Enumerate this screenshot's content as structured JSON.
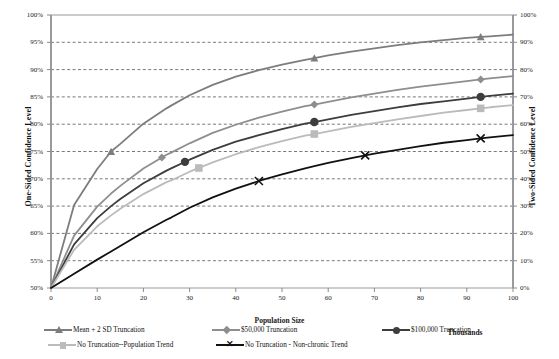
{
  "chart_data": {
    "type": "line",
    "title": "",
    "xlabel": "Population Size",
    "x_units_label": "Thousands",
    "ylabel": "One-Sided Confidence Level",
    "y2label": "Two-Sided Confidence Level",
    "grid": true,
    "legend_position": "bottom",
    "xlim": [
      0,
      100
    ],
    "xticks": [
      0,
      10,
      20,
      30,
      40,
      50,
      60,
      70,
      80,
      90,
      100
    ],
    "xtick_labels": [
      "0",
      "10",
      "20",
      "30",
      "40",
      "50",
      "60",
      "70",
      "80",
      "90",
      "100"
    ],
    "ylim": [
      0.5,
      1.0
    ],
    "yticks": [
      0.5,
      0.55,
      0.6,
      0.65,
      0.7,
      0.75,
      0.8,
      0.85,
      0.9,
      0.95,
      1.0
    ],
    "ytick_labels": [
      "50%",
      "55%",
      "60%",
      "65%",
      "70%",
      "75%",
      "80%",
      "85%",
      "90%",
      "95%",
      "100%"
    ],
    "y2lim": [
      0.0,
      1.0
    ],
    "y2ticks": [
      0,
      0.1,
      0.2,
      0.3,
      0.4,
      0.5,
      0.6,
      0.7,
      0.8,
      0.9,
      1.0
    ],
    "y2tick_labels": [
      "0%",
      "10%",
      "20%",
      "30%",
      "40%",
      "50%",
      "60%",
      "70%",
      "80%",
      "90%",
      "100%"
    ],
    "x": [
      0,
      5,
      10,
      13,
      15,
      20,
      25,
      26,
      30,
      35,
      40,
      45,
      50,
      55,
      57,
      60,
      65,
      70,
      75,
      80,
      85,
      90,
      93,
      95,
      100
    ],
    "series": [
      {
        "name": "Mean + 2 SD Truncation",
        "color": "#7d7d7d",
        "marker": "triangle",
        "marker_x": [
          13,
          57,
          93
        ],
        "values": [
          50.0,
          65.2,
          71.8,
          75.0,
          76.4,
          80.1,
          82.9,
          83.4,
          85.3,
          87.2,
          88.7,
          89.9,
          90.9,
          91.8,
          92.1,
          92.6,
          93.3,
          93.9,
          94.5,
          95.0,
          95.4,
          95.8,
          96.0,
          96.1,
          96.4
        ]
      },
      {
        "name": "$50,000 Truncation",
        "color": "#8e8e8e",
        "marker": "diamond",
        "marker_x": [
          24,
          57,
          93
        ],
        "values": [
          50.0,
          59.6,
          64.9,
          67.3,
          68.7,
          71.9,
          74.4,
          74.8,
          76.5,
          78.4,
          79.9,
          81.2,
          82.3,
          83.3,
          83.6,
          84.1,
          84.9,
          85.6,
          86.3,
          86.9,
          87.4,
          87.9,
          88.2,
          88.4,
          88.8
        ]
      },
      {
        "name": "$100,000 Truncation",
        "color": "#3d3d3d",
        "marker": "circle",
        "marker_x": [
          29,
          57,
          93
        ],
        "values": [
          50.0,
          58.0,
          62.8,
          65.0,
          66.3,
          69.2,
          71.5,
          71.9,
          73.5,
          75.3,
          76.8,
          78.0,
          79.1,
          80.1,
          80.4,
          80.9,
          81.7,
          82.4,
          83.1,
          83.7,
          84.2,
          84.7,
          85.0,
          85.2,
          85.6
        ]
      },
      {
        "name": "No Truncation--Population Trend",
        "color": "#bbbbbb",
        "marker": "square",
        "marker_x": [
          32,
          57,
          93
        ],
        "values": [
          50.0,
          57.0,
          61.3,
          63.3,
          64.5,
          67.2,
          69.4,
          69.7,
          71.3,
          73.0,
          74.5,
          75.8,
          76.9,
          77.9,
          78.2,
          78.7,
          79.5,
          80.2,
          80.9,
          81.5,
          82.1,
          82.6,
          82.9,
          83.1,
          83.5
        ]
      },
      {
        "name": "No Truncation - Non-chronic Trend",
        "color": "#111111",
        "marker": "x",
        "marker_x": [
          45,
          68,
          93
        ],
        "values": [
          50.0,
          52.6,
          55.2,
          56.7,
          57.7,
          60.2,
          62.5,
          62.9,
          64.7,
          66.6,
          68.2,
          69.6,
          70.8,
          71.9,
          72.3,
          72.9,
          73.8,
          74.6,
          75.3,
          76.0,
          76.6,
          77.1,
          77.4,
          77.6,
          78.0
        ]
      }
    ]
  },
  "axes": {
    "left_title": "One-Sided Confidence Level",
    "right_title": "Two-Sided Confidence Level",
    "bottom_title": "Population Size",
    "units": "Thousands"
  },
  "legend": {
    "items": [
      {
        "label": "Mean + 2 SD Truncation",
        "color": "#7d7d7d",
        "marker": "triangle"
      },
      {
        "label": "$50,000 Truncation",
        "color": "#8e8e8e",
        "marker": "diamond"
      },
      {
        "label": "$100,000 Truncation",
        "color": "#3d3d3d",
        "marker": "circle"
      },
      {
        "label": "No Truncation--Population Trend",
        "color": "#bbbbbb",
        "marker": "square"
      },
      {
        "label": "No Truncation - Non-chronic Trend",
        "color": "#111111",
        "marker": "x"
      }
    ]
  },
  "colors": {
    "grid": "#555555",
    "axis": "#8a8a8a",
    "background": "#ffffff"
  }
}
